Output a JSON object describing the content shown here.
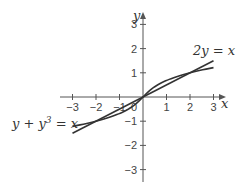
{
  "chart_data": {
    "type": "line",
    "title": "",
    "xlabel": "x",
    "ylabel": "y",
    "xlim": [
      -3,
      3
    ],
    "ylim": [
      -3,
      3
    ],
    "grid": false,
    "x_ticks": [
      "-3",
      "-2",
      "-1",
      "0",
      "1",
      "2",
      "3"
    ],
    "y_ticks": [
      "3",
      "2",
      "1",
      "-1",
      "-2",
      "-3"
    ],
    "series": [
      {
        "name": "2y = x",
        "label": "2y = x",
        "equation": "y = x/2",
        "x": [
          -3,
          3
        ],
        "y": [
          -1.5,
          1.5
        ]
      },
      {
        "name": "y + y^3 = x",
        "label_main": "y + y",
        "label_sup": "3",
        "label_end": " = x",
        "x": [
          -3,
          -2,
          -1,
          0,
          1,
          2,
          3
        ],
        "y": [
          -1.213,
          -1.0,
          -0.682,
          0,
          0.682,
          1.0,
          1.213
        ]
      }
    ],
    "intersections": [
      [
        -2,
        -1
      ],
      [
        0,
        0
      ],
      [
        2,
        1
      ]
    ]
  }
}
